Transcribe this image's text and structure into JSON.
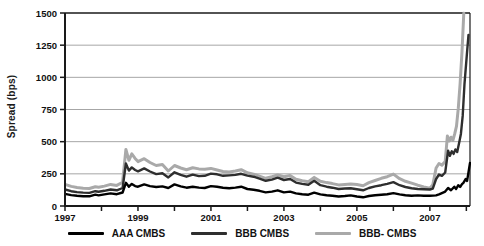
{
  "figure": {
    "background": "#ffffff"
  },
  "chart_data": {
    "type": "line",
    "title": "",
    "ylabel": "Spread (bps)",
    "xlabel": "",
    "ylim": [
      0,
      1500
    ],
    "xlim": [
      1997,
      2008.1
    ],
    "y_ticks": [
      0,
      250,
      500,
      750,
      1000,
      1250,
      1500
    ],
    "x_ticks": [
      1997,
      1998,
      1999,
      2000,
      2001,
      2002,
      2003,
      2004,
      2005,
      2006,
      2007,
      2008
    ],
    "x_tick_labels": [
      "1997",
      "",
      "1999",
      "",
      "2001",
      "",
      "2003",
      "",
      "2005",
      "",
      "2007",
      ""
    ],
    "grid": "horizontal gridlines at each 250 bps",
    "legend_position": "bottom",
    "axis_color": "#1a1a1a",
    "grid_color": "#8f8f8f",
    "series": [
      {
        "name": "BBB- CMBS",
        "color": "#a9a9a9",
        "stroke_width": 3,
        "points": [
          [
            1997.0,
            168
          ],
          [
            1997.17,
            152
          ],
          [
            1997.33,
            144
          ],
          [
            1997.5,
            138
          ],
          [
            1997.67,
            136
          ],
          [
            1997.83,
            150
          ],
          [
            1997.92,
            145
          ],
          [
            1998.08,
            155
          ],
          [
            1998.25,
            168
          ],
          [
            1998.42,
            160
          ],
          [
            1998.58,
            185
          ],
          [
            1998.67,
            440
          ],
          [
            1998.75,
            355
          ],
          [
            1998.83,
            405
          ],
          [
            1998.92,
            370
          ],
          [
            1999.0,
            345
          ],
          [
            1999.17,
            368
          ],
          [
            1999.33,
            338
          ],
          [
            1999.5,
            315
          ],
          [
            1999.67,
            322
          ],
          [
            1999.83,
            272
          ],
          [
            2000.0,
            315
          ],
          [
            2000.17,
            295
          ],
          [
            2000.33,
            282
          ],
          [
            2000.5,
            298
          ],
          [
            2000.67,
            288
          ],
          [
            2000.83,
            285
          ],
          [
            2001.0,
            292
          ],
          [
            2001.17,
            280
          ],
          [
            2001.33,
            268
          ],
          [
            2001.5,
            265
          ],
          [
            2001.67,
            272
          ],
          [
            2001.83,
            282
          ],
          [
            2002.0,
            258
          ],
          [
            2002.17,
            248
          ],
          [
            2002.33,
            232
          ],
          [
            2002.5,
            215
          ],
          [
            2002.67,
            228
          ],
          [
            2002.83,
            242
          ],
          [
            2003.0,
            228
          ],
          [
            2003.17,
            236
          ],
          [
            2003.33,
            208
          ],
          [
            2003.5,
            196
          ],
          [
            2003.67,
            188
          ],
          [
            2003.83,
            222
          ],
          [
            2004.0,
            192
          ],
          [
            2004.17,
            182
          ],
          [
            2004.33,
            174
          ],
          [
            2004.5,
            164
          ],
          [
            2004.67,
            168
          ],
          [
            2004.83,
            172
          ],
          [
            2005.0,
            166
          ],
          [
            2005.17,
            158
          ],
          [
            2005.33,
            182
          ],
          [
            2005.5,
            198
          ],
          [
            2005.67,
            215
          ],
          [
            2005.83,
            228
          ],
          [
            2006.0,
            248
          ],
          [
            2006.17,
            212
          ],
          [
            2006.33,
            192
          ],
          [
            2006.5,
            178
          ],
          [
            2006.67,
            162
          ],
          [
            2006.83,
            148
          ],
          [
            2007.0,
            138
          ],
          [
            2007.08,
            165
          ],
          [
            2007.17,
            295
          ],
          [
            2007.25,
            330
          ],
          [
            2007.33,
            318
          ],
          [
            2007.42,
            345
          ],
          [
            2007.48,
            545
          ],
          [
            2007.53,
            505
          ],
          [
            2007.58,
            535
          ],
          [
            2007.63,
            510
          ],
          [
            2007.68,
            560
          ],
          [
            2007.73,
            620
          ],
          [
            2007.78,
            760
          ],
          [
            2007.83,
            950
          ],
          [
            2007.88,
            1200
          ],
          [
            2007.93,
            1500
          ]
        ]
      },
      {
        "name": "BBB CMBS",
        "color": "#2e2e2e",
        "stroke_width": 2.4,
        "points": [
          [
            1997.0,
            128
          ],
          [
            1997.17,
            115
          ],
          [
            1997.33,
            108
          ],
          [
            1997.5,
            104
          ],
          [
            1997.67,
            102
          ],
          [
            1997.83,
            115
          ],
          [
            1997.92,
            110
          ],
          [
            1998.08,
            118
          ],
          [
            1998.25,
            128
          ],
          [
            1998.42,
            122
          ],
          [
            1998.58,
            140
          ],
          [
            1998.67,
            330
          ],
          [
            1998.75,
            275
          ],
          [
            1998.83,
            300
          ],
          [
            1998.92,
            280
          ],
          [
            1999.0,
            270
          ],
          [
            1999.17,
            292
          ],
          [
            1999.33,
            268
          ],
          [
            1999.5,
            248
          ],
          [
            1999.67,
            255
          ],
          [
            1999.83,
            222
          ],
          [
            2000.0,
            262
          ],
          [
            2000.17,
            242
          ],
          [
            2000.33,
            228
          ],
          [
            2000.5,
            244
          ],
          [
            2000.67,
            232
          ],
          [
            2000.83,
            235
          ],
          [
            2001.0,
            252
          ],
          [
            2001.17,
            246
          ],
          [
            2001.33,
            235
          ],
          [
            2001.5,
            238
          ],
          [
            2001.67,
            242
          ],
          [
            2001.83,
            250
          ],
          [
            2002.0,
            236
          ],
          [
            2002.17,
            228
          ],
          [
            2002.33,
            212
          ],
          [
            2002.5,
            196
          ],
          [
            2002.67,
            205
          ],
          [
            2002.83,
            220
          ],
          [
            2003.0,
            202
          ],
          [
            2003.17,
            210
          ],
          [
            2003.33,
            182
          ],
          [
            2003.5,
            172
          ],
          [
            2003.67,
            165
          ],
          [
            2003.83,
            196
          ],
          [
            2004.0,
            162
          ],
          [
            2004.17,
            150
          ],
          [
            2004.33,
            142
          ],
          [
            2004.5,
            132
          ],
          [
            2004.67,
            136
          ],
          [
            2004.83,
            138
          ],
          [
            2005.0,
            130
          ],
          [
            2005.17,
            122
          ],
          [
            2005.33,
            140
          ],
          [
            2005.5,
            152
          ],
          [
            2005.67,
            162
          ],
          [
            2005.83,
            172
          ],
          [
            2006.0,
            186
          ],
          [
            2006.17,
            162
          ],
          [
            2006.33,
            148
          ],
          [
            2006.5,
            138
          ],
          [
            2006.67,
            132
          ],
          [
            2006.83,
            130
          ],
          [
            2007.0,
            128
          ],
          [
            2007.08,
            135
          ],
          [
            2007.17,
            210
          ],
          [
            2007.25,
            245
          ],
          [
            2007.33,
            235
          ],
          [
            2007.42,
            260
          ],
          [
            2007.5,
            430
          ],
          [
            2007.55,
            390
          ],
          [
            2007.6,
            425
          ],
          [
            2007.65,
            405
          ],
          [
            2007.7,
            440
          ],
          [
            2007.75,
            420
          ],
          [
            2007.8,
            490
          ],
          [
            2007.85,
            560
          ],
          [
            2007.9,
            700
          ],
          [
            2007.95,
            950
          ],
          [
            2008.02,
            1200
          ],
          [
            2008.06,
            1330
          ]
        ]
      },
      {
        "name": "AAA CMBS",
        "color": "#000000",
        "stroke_width": 2.4,
        "points": [
          [
            1997.0,
            95
          ],
          [
            1997.17,
            85
          ],
          [
            1997.33,
            80
          ],
          [
            1997.5,
            76
          ],
          [
            1997.67,
            75
          ],
          [
            1997.83,
            88
          ],
          [
            1997.92,
            82
          ],
          [
            1998.08,
            90
          ],
          [
            1998.25,
            98
          ],
          [
            1998.42,
            92
          ],
          [
            1998.58,
            105
          ],
          [
            1998.67,
            180
          ],
          [
            1998.75,
            150
          ],
          [
            1998.83,
            172
          ],
          [
            1998.92,
            155
          ],
          [
            1999.0,
            150
          ],
          [
            1999.17,
            168
          ],
          [
            1999.33,
            155
          ],
          [
            1999.5,
            148
          ],
          [
            1999.67,
            152
          ],
          [
            1999.83,
            140
          ],
          [
            2000.0,
            168
          ],
          [
            2000.17,
            152
          ],
          [
            2000.33,
            142
          ],
          [
            2000.5,
            150
          ],
          [
            2000.67,
            143
          ],
          [
            2000.83,
            140
          ],
          [
            2001.0,
            155
          ],
          [
            2001.17,
            150
          ],
          [
            2001.33,
            142
          ],
          [
            2001.5,
            138
          ],
          [
            2001.67,
            143
          ],
          [
            2001.83,
            150
          ],
          [
            2002.0,
            132
          ],
          [
            2002.17,
            126
          ],
          [
            2002.33,
            118
          ],
          [
            2002.5,
            106
          ],
          [
            2002.67,
            112
          ],
          [
            2002.83,
            122
          ],
          [
            2003.0,
            106
          ],
          [
            2003.17,
            112
          ],
          [
            2003.33,
            98
          ],
          [
            2003.5,
            92
          ],
          [
            2003.67,
            88
          ],
          [
            2003.83,
            104
          ],
          [
            2004.0,
            90
          ],
          [
            2004.17,
            84
          ],
          [
            2004.33,
            80
          ],
          [
            2004.5,
            74
          ],
          [
            2004.67,
            78
          ],
          [
            2004.83,
            82
          ],
          [
            2005.0,
            74
          ],
          [
            2005.17,
            68
          ],
          [
            2005.33,
            78
          ],
          [
            2005.5,
            84
          ],
          [
            2005.67,
            88
          ],
          [
            2005.83,
            92
          ],
          [
            2006.0,
            100
          ],
          [
            2006.17,
            90
          ],
          [
            2006.33,
            84
          ],
          [
            2006.5,
            80
          ],
          [
            2006.67,
            82
          ],
          [
            2006.83,
            80
          ],
          [
            2007.0,
            79
          ],
          [
            2007.17,
            82
          ],
          [
            2007.25,
            90
          ],
          [
            2007.33,
            100
          ],
          [
            2007.42,
            112
          ],
          [
            2007.5,
            140
          ],
          [
            2007.58,
            122
          ],
          [
            2007.67,
            150
          ],
          [
            2007.72,
            132
          ],
          [
            2007.78,
            162
          ],
          [
            2007.83,
            148
          ],
          [
            2007.88,
            170
          ],
          [
            2007.92,
            180
          ],
          [
            2007.98,
            210
          ],
          [
            2008.02,
            195
          ],
          [
            2008.1,
            335
          ]
        ]
      }
    ]
  },
  "legend": {
    "items": [
      {
        "label": "AAA CMBS",
        "color": "#000000"
      },
      {
        "label": "BBB CMBS",
        "color": "#2e2e2e"
      },
      {
        "label": "BBB- CMBS",
        "color": "#a9a9a9"
      }
    ]
  }
}
